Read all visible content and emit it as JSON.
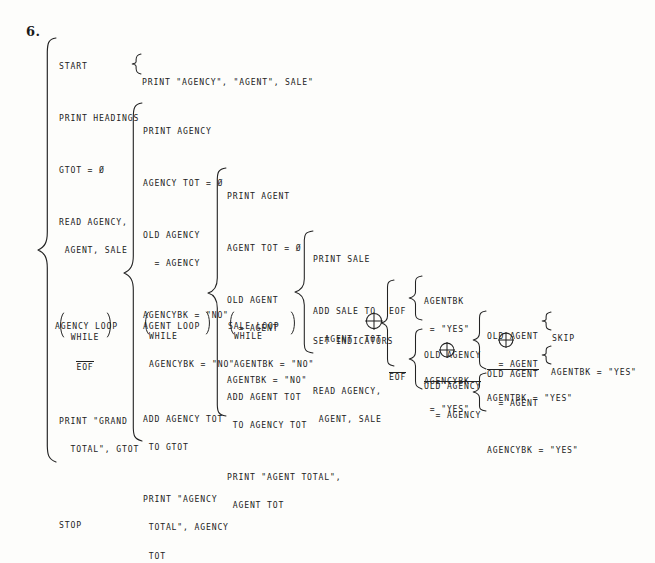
{
  "page": {
    "problem_number": "6.",
    "diagram_type": "Warnier-Orr structured program diagram",
    "xor_symbol": "circled-plus"
  },
  "level1": {
    "label_lines": [
      "AGENCY LOOP"
    ],
    "loop_condition": [
      "WHILE",
      "EOF"
    ],
    "loop_condition_negated": true,
    "items": {
      "start": "START",
      "print_headings": "PRINT HEADINGS",
      "gtot_init": "GTOT = Ø",
      "read_1": "READ AGENCY,",
      "read_2": " AGENT, SALE",
      "print_grand_1": "PRINT \"GRAND",
      "print_grand_2": "  TOTAL\", GTOT",
      "stop": "STOP"
    }
  },
  "headings_detail": "PRINT \"AGENCY\", \"AGENT\", SALE\"",
  "level2": {
    "label_lines": [
      "AGENT LOOP"
    ],
    "loop_condition": [
      "WHILE",
      "AGENCYBK = \"NO\""
    ],
    "top_items": {
      "print_agency": "PRINT AGENCY",
      "agency_tot_init": "AGENCY TOT = Ø",
      "old_agency_1": "OLD AGENCY",
      "old_agency_2": "  = AGENCY",
      "agencybk": "AGENCYBK = \"NO\""
    },
    "bottom_items": {
      "add_agency_tot_1": "ADD AGENCY TOT",
      "add_agency_tot_2": " TO GTOT",
      "print_agency_total_1": "PRINT \"AGENCY",
      "print_agency_total_2": " TOTAL\", AGENCY",
      "print_agency_total_3": " TOT"
    }
  },
  "level3": {
    "label_lines": [
      "SALE LOOP"
    ],
    "loop_condition": [
      "WHILE",
      "AGENTBK = \"NO\""
    ],
    "top_items": {
      "print_agent": "PRINT AGENT",
      "agent_tot_init": "AGENT TOT = Ø",
      "old_agent_1": "OLD AGENT",
      "old_agent_2": "  = AGENT",
      "agentbk": "AGENTBK = \"NO\""
    },
    "bottom_items": {
      "add_agent_tot_1": "ADD AGENT TOT",
      "add_agent_tot_2": " TO AGENCY TOT",
      "print_agent_total_1": "PRINT \"AGENT TOTAL\",",
      "print_agent_total_2": " AGENT TOT"
    }
  },
  "level4": {
    "items": {
      "print_sale": "PRINT SALE",
      "add_sale_1": "ADD SALE TO",
      "add_sale_2": "  AGENT  TOT",
      "read_1": "READ AGENCY,",
      "read_2": " AGENT, SALE",
      "set_indicators": "SET INDICATORS"
    }
  },
  "indicators": {
    "eof_label": "EOF",
    "not_eof_label": "EOF",
    "eof_branch": {
      "line1": "AGENTBK",
      "line2": " = \"YES\"",
      "line3": "AGENCYBK",
      "line4": " = \"YES\""
    },
    "not_eof_branch": {
      "old_agency_1": "OLD AGENCY",
      "old_agency_not_1": "OLD AGENCY",
      "old_agency_not_2": "  = AGENCY",
      "agency_eq_branch": {
        "old_agent_1": "OLD AGENT",
        "old_agent_2": "  = AGENT",
        "skip": "SKIP",
        "old_agent_not_1": "OLD AGENT",
        "old_agent_not_2": "  = AGENT",
        "agentbk_yes": "AGENTBK = \"YES\""
      },
      "agency_ne_branch": {
        "agentbk_yes": "AGENTBK = \"YES\"",
        "agencybk_yes": "AGENCYBK = \"YES\""
      }
    }
  }
}
